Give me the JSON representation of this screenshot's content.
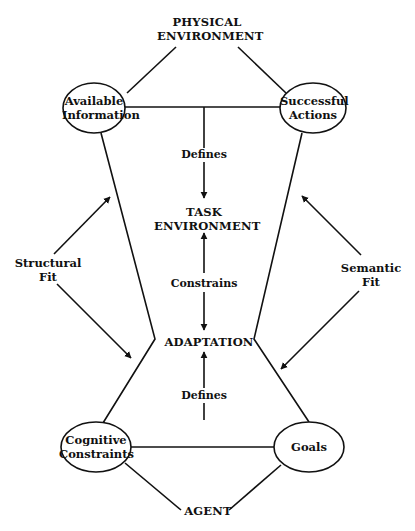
{
  "diagram": {
    "top": {
      "line1": "PHYSICAL",
      "line2": "ENVIRONMENT"
    },
    "center": {
      "line1": "TASK",
      "line2": "ENVIRONMENT"
    },
    "middle": "ADAPTATION",
    "bottom": "AGENT",
    "nodes": {
      "available_information": {
        "line1": "Available",
        "line2": "Information"
      },
      "successful_actions": {
        "line1": "Successful",
        "line2": "Actions"
      },
      "cognitive_constraints": {
        "line1": "Cognitive",
        "line2": "Constraints"
      },
      "goals": "Goals"
    },
    "relations": {
      "defines_top": "Defines",
      "constrains": "Constrains",
      "defines_bottom": "Defines"
    },
    "fits": {
      "structural": {
        "line1": "Structural",
        "line2": "Fit"
      },
      "semantic": {
        "line1": "Semantic",
        "line2": "Fit"
      }
    },
    "colors": {
      "stroke": "#111111",
      "background": "#ffffff"
    }
  }
}
